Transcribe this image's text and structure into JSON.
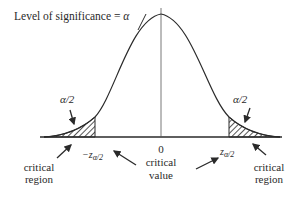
{
  "title": {
    "prefix": "Level of significance = ",
    "symbol": "α"
  },
  "tails": {
    "left": {
      "area_label": "α/2",
      "region_line1": "critical",
      "region_line2": "region",
      "z_minus": "−z",
      "z_sub": "α/2"
    },
    "right": {
      "area_label": "α/2",
      "region_line1": "critical",
      "region_line2": "region",
      "z": "z",
      "z_sub": "α/2"
    }
  },
  "center": {
    "zero": "0",
    "line1": "critical",
    "line2": "value"
  },
  "colors": {
    "ink": "#2a2a2a",
    "background": "#ffffff"
  }
}
